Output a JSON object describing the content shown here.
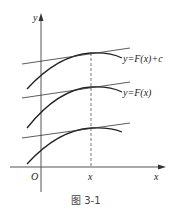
{
  "figure": {
    "caption": "图 3-1",
    "axes": {
      "y_label": "y",
      "x_label": "x",
      "origin_label": "O",
      "x_point_label": "x"
    },
    "curves": [
      {
        "label": "y=F(x)+c"
      },
      {
        "label": "y=F(x)"
      },
      {
        "label": ""
      }
    ]
  }
}
